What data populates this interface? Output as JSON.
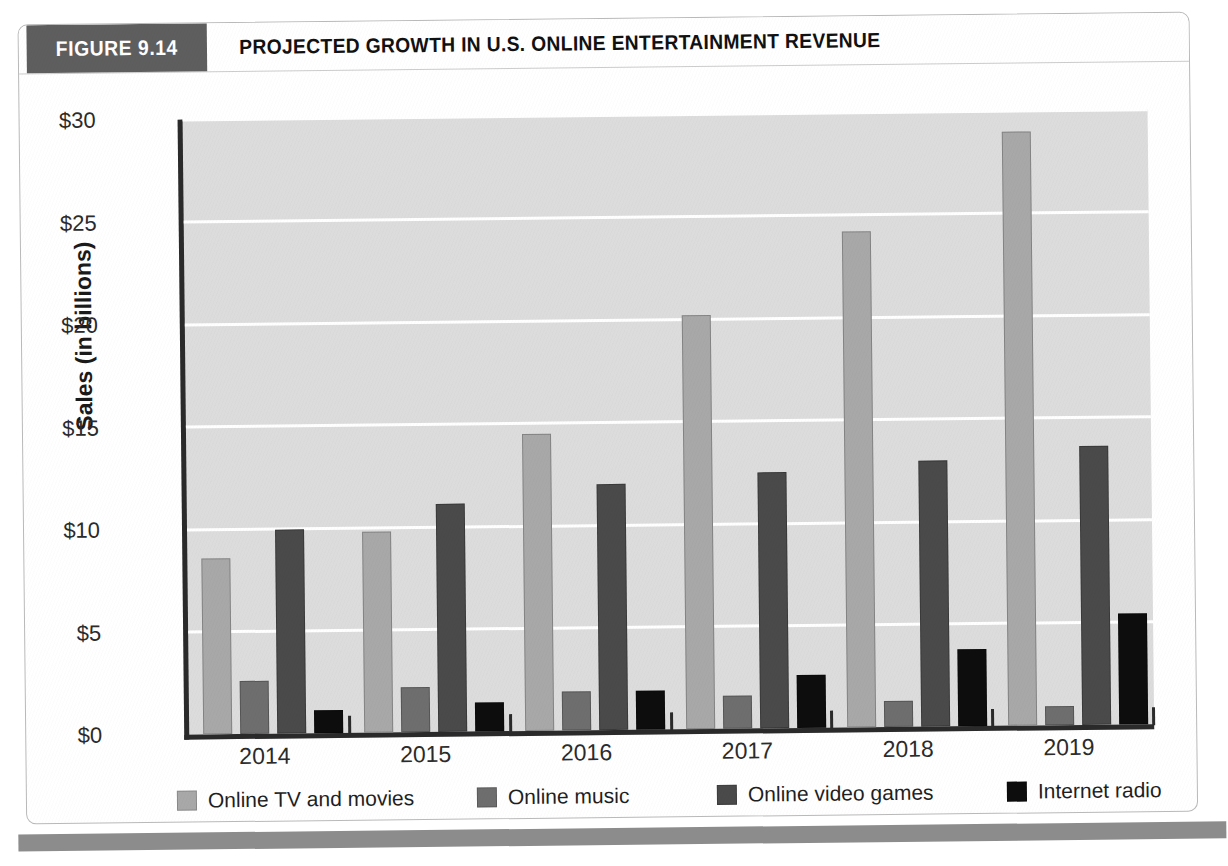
{
  "figure": {
    "number_label": "FIGURE 9.14",
    "title": "PROJECTED GROWTH IN U.S. ONLINE ENTERTAINMENT REVENUE"
  },
  "colors": {
    "header_badge_bg": "#5e5e5e",
    "plot_bg": "#dcdcdc",
    "gridline": "#ffffff",
    "axis": "#2a2a2a",
    "online_tv_and_movies": "#a8a8a8",
    "online_music": "#6e6e6e",
    "online_video_games": "#4a4a4a",
    "internet_radio": "#0d0d0d",
    "footer_rule": "#8c8c8c"
  },
  "chart_data": {
    "type": "bar",
    "title": "PROJECTED GROWTH IN U.S. ONLINE ENTERTAINMENT REVENUE",
    "xlabel": "",
    "ylabel": "Sales (in billions)",
    "categories": [
      "2014",
      "2015",
      "2016",
      "2017",
      "2018",
      "2019"
    ],
    "ylim": [
      0,
      30
    ],
    "yticks": [
      0,
      5,
      10,
      15,
      20,
      25,
      30
    ],
    "ytick_labels": [
      "$0",
      "$5",
      "$10",
      "$15",
      "$20",
      "$25",
      "$30"
    ],
    "grid": true,
    "legend_position": "bottom",
    "series": [
      {
        "name": "Online TV and movies",
        "color": "#a8a8a8",
        "values": [
          8.6,
          9.8,
          14.5,
          20.2,
          24.2,
          29.0
        ]
      },
      {
        "name": "Online music",
        "color": "#6e6e6e",
        "values": [
          2.6,
          2.2,
          1.9,
          1.6,
          1.25,
          0.95
        ]
      },
      {
        "name": "Online video games",
        "color": "#4a4a4a",
        "values": [
          9.95,
          11.1,
          12.0,
          12.5,
          13.0,
          13.6
        ]
      },
      {
        "name": "Internet radio",
        "color": "#0d0d0d",
        "values": [
          1.1,
          1.4,
          1.9,
          2.6,
          3.75,
          5.4
        ]
      }
    ]
  }
}
